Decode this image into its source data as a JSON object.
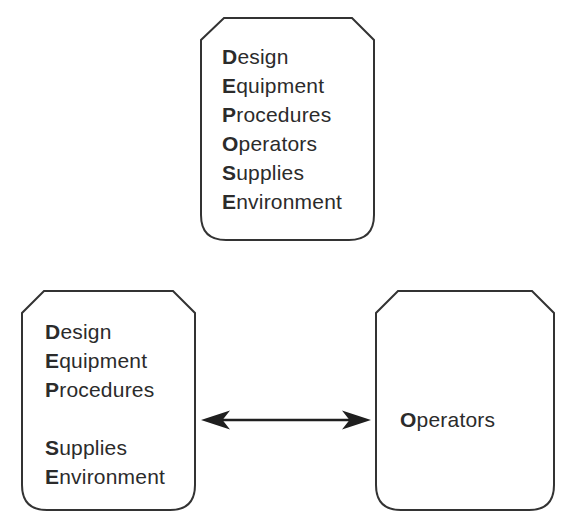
{
  "diagram": {
    "colors": {
      "ink": "#2b2b2b",
      "border": "#333333",
      "arrow": "#1f1f1f",
      "background": "#ffffff",
      "box_fill": "#ffffff"
    },
    "boxes": {
      "top": {
        "items": [
          {
            "initial": "D",
            "rest": "esign"
          },
          {
            "initial": "E",
            "rest": "quipment"
          },
          {
            "initial": "P",
            "rest": "rocedures"
          },
          {
            "initial": "O",
            "rest": "perators"
          },
          {
            "initial": "S",
            "rest": "upplies"
          },
          {
            "initial": "E",
            "rest": "nvironment"
          }
        ]
      },
      "bottom_left": {
        "items": [
          {
            "initial": "D",
            "rest": "esign"
          },
          {
            "initial": "E",
            "rest": "quipment"
          },
          {
            "initial": "P",
            "rest": "rocedures"
          },
          {
            "initial": "",
            "rest": ""
          },
          {
            "initial": "S",
            "rest": "upplies"
          },
          {
            "initial": "E",
            "rest": "nvironment"
          }
        ]
      },
      "bottom_right": {
        "items": [
          {
            "initial": "O",
            "rest": "perators"
          }
        ]
      }
    },
    "arrow": {
      "type": "double-headed",
      "connects": "bottom_left and bottom_right boxes"
    }
  }
}
